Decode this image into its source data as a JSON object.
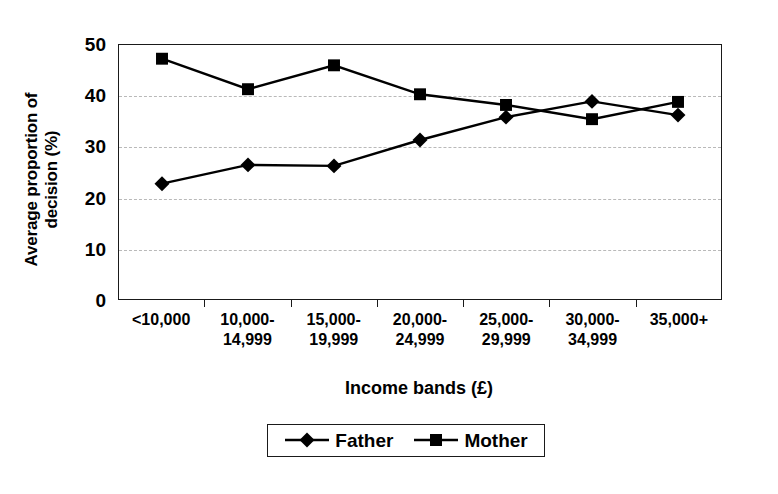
{
  "chart_data": {
    "type": "line",
    "title": "",
    "xlabel": "Income bands (£)",
    "ylabel": "Average proportion of decision (%)",
    "ylabel_lines": [
      "Average proportion of",
      "decision (%)"
    ],
    "categories": [
      [
        "<10,000"
      ],
      [
        "10,000-",
        "14,999"
      ],
      [
        "15,000-",
        "19,999"
      ],
      [
        "20,000-",
        "24,999"
      ],
      [
        "25,000-",
        "29,999"
      ],
      [
        "30,000-",
        "34,999"
      ],
      [
        "35,000+"
      ]
    ],
    "category_labels": [
      "<10,000",
      "10,000-14,999",
      "15,000-19,999",
      "20,000-24,999",
      "25,000-29,999",
      "30,000-34,999",
      "35,000+"
    ],
    "series": [
      {
        "name": "Father",
        "marker": "diamond",
        "values": [
          22.7,
          26.4,
          26.2,
          31.3,
          35.8,
          38.9,
          36.2
        ]
      },
      {
        "name": "Mother",
        "marker": "square",
        "values": [
          47.3,
          41.3,
          46.0,
          40.3,
          38.2,
          35.4,
          38.8
        ]
      }
    ],
    "ylim": [
      0,
      50
    ],
    "yticks": [
      0,
      10,
      20,
      30,
      40,
      50
    ],
    "ytick_labels": [
      "0",
      "10",
      "20",
      "30",
      "40",
      "50"
    ],
    "grid": true,
    "gridlines_at": [
      10,
      20,
      30,
      40
    ],
    "grid_style": "dashed",
    "legend_position": "bottom",
    "legend_entries": [
      "Father",
      "Mother"
    ],
    "line_color": "#000000",
    "marker_color": "#000000",
    "grid_color": "#b9b9b9",
    "axis_color": "#1a1a1a",
    "background": "#ffffff"
  }
}
